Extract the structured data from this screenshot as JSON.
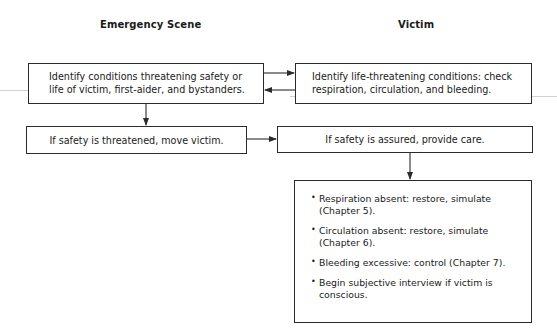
{
  "columns": {
    "left_header": "Emergency Scene",
    "right_header": "Victim"
  },
  "boxes": {
    "identify_conditions": {
      "lines": [
        "Identify conditions threatening safety or",
        "life of victim, first-aider, and bystanders."
      ]
    },
    "identify_life_threatening": {
      "lines": [
        "Identify life-threatening conditions: check",
        "respiration, circulation, and bleeding."
      ]
    },
    "move_victim": {
      "text": "If safety is threatened, move victim."
    },
    "provide_care": {
      "text": "If safety is assured, provide care."
    },
    "care_steps": {
      "bullet": "•",
      "items": [
        {
          "lines": [
            "Respiration absent: restore, simulate",
            "(Chapter 5)."
          ]
        },
        {
          "lines": [
            "Circulation absent: restore, simulate",
            "(Chapter 6)."
          ]
        },
        {
          "lines": [
            "Bleeding excessive: control (Chapter 7)."
          ]
        },
        {
          "lines": [
            "Begin subjective interview if victim is",
            "conscious."
          ]
        }
      ]
    }
  },
  "colors": {
    "line": "#2b2b2b",
    "text": "#1a1a1a",
    "background": "#ffffff"
  }
}
